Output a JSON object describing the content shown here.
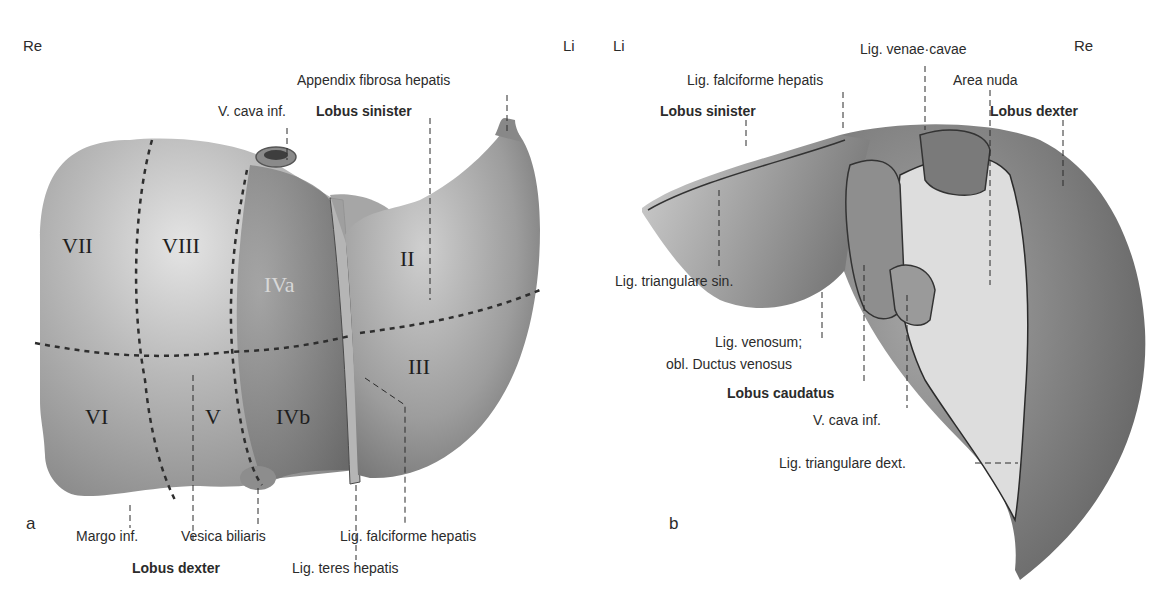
{
  "figure": {
    "panel_a": {
      "letter": "a",
      "orientation_left": "Re",
      "orientation_right": "Li",
      "labels": {
        "appendix_fibrosa": "Appendix fibrosa hepatis",
        "v_cava": "V. cava inf.",
        "lobus_sinister": "Lobus sinister",
        "margo_inf": "Margo inf.",
        "vesica_biliaris": "Vesica biliaris",
        "lig_falciforme": "Lig. falciforme hepatis",
        "lobus_dexter": "Lobus dexter",
        "lig_teres": "Lig. teres hepatis"
      },
      "segments": {
        "s7": "VII",
        "s8": "VIII",
        "s4a": "IVa",
        "s2": "II",
        "s3": "III",
        "s6": "VI",
        "s5": "V",
        "s4b": "IVb"
      }
    },
    "panel_b": {
      "letter": "b",
      "orientation_left": "Li",
      "orientation_right": "Re",
      "labels": {
        "lig_venae_cavae": "Lig. venae·cavae",
        "lig_falciforme": "Lig. falciforme hepatis",
        "area_nuda": "Area nuda",
        "lobus_sinister": "Lobus sinister",
        "lobus_dexter": "Lobus dexter",
        "lig_triangulare_sin": "Lig. triangulare sin.",
        "lig_venosum_1": "Lig. venosum;",
        "lig_venosum_2": "obl. Ductus venosus",
        "lobus_caudatus": "Lobus caudatus",
        "v_cava": "V. cava inf.",
        "lig_triangulare_dext": "Lig. triangulare dext."
      }
    },
    "colors": {
      "background": "#ffffff",
      "text": "#2b2b2b",
      "liver_light": "#c4c4c4",
      "liver_mid": "#9a9a9a",
      "liver_dark": "#5e5e5e",
      "area_nuda": "#e2e2e2"
    }
  }
}
